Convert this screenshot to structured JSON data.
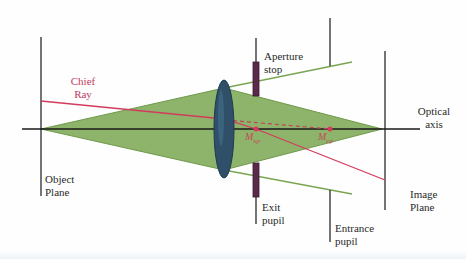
{
  "diagram": {
    "colors": {
      "background": "#fdfefd",
      "ray_bundle_fill": "#8db46a",
      "ray_bundle_edge": "#6f9a4a",
      "lens": "#2f5068",
      "stop": "#5a2a4a",
      "chief_ray": "#d43a5e",
      "axis": "#1a1a1a",
      "planes": "#2a2a2a",
      "text": "#2a2a2a",
      "chief_label": "#c03a62"
    },
    "labels": {
      "chief_ray_line1": "Chief",
      "chief_ray_line2": "Ray",
      "aperture_stop_line1": "Aperture",
      "aperture_stop_line2": "stop",
      "optical_axis_line1": "Optical",
      "optical_axis_line2": "axis",
      "object_plane_line1": "Object",
      "object_plane_line2": "Plane",
      "exit_pupil_line1": "Exit",
      "exit_pupil_line2": "pupil",
      "entrance_pupil_line1": "Entrance",
      "entrance_pupil_line2": "pupil",
      "image_plane_line1": "Image",
      "image_plane_line2": "Plane",
      "m_xp_main": "M",
      "m_xp_sub": "xp",
      "m_ep_main": "M",
      "m_ep_sub": "ep"
    }
  }
}
